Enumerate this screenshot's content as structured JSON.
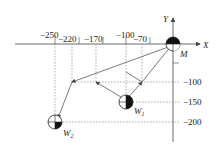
{
  "axes": {
    "x_label": "X",
    "y_label": "Y",
    "origin_label": "M",
    "x_ticks": [
      "−250",
      "−220",
      "−170",
      "−100",
      "−70"
    ],
    "y_ticks": [
      "−100",
      "−150",
      "−200"
    ]
  },
  "points": {
    "w1": {
      "label": "W",
      "sub": "1",
      "x": -100,
      "y": -150
    },
    "w2": {
      "label": "W",
      "sub": "2",
      "x": -250,
      "y": -200
    },
    "m": {
      "label": "M",
      "x": 0,
      "y": 0
    }
  },
  "colors": {
    "line": "#444444",
    "dash": "#777777",
    "fill": "#111111"
  }
}
